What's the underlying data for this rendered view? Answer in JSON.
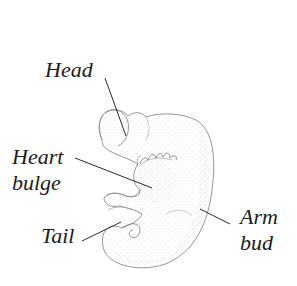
{
  "diagram": {
    "colors": {
      "outline": "#8a8a8a",
      "stipple": "#b5b5b5",
      "leader": "#2a2a2a",
      "text": "#1c1c1c",
      "background": "#ffffff"
    },
    "labels": {
      "head": "Head",
      "heart_line1": "Heart",
      "heart_line2": "bulge",
      "tail": "Tail",
      "arm_line1": "Arm",
      "arm_line2": "bud"
    }
  }
}
